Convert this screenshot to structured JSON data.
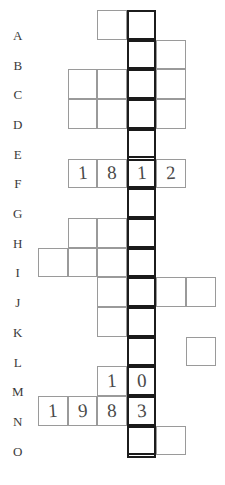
{
  "puzzle": {
    "type": "numeric-crossword-grid",
    "row_count": 15,
    "column_count": 7,
    "row_labels": [
      "A",
      "B",
      "C",
      "D",
      "E",
      "F",
      "G",
      "H",
      "I",
      "J",
      "K",
      "L",
      "M",
      "N",
      "O"
    ],
    "highlighted_column_label": "bold-double-column",
    "grid_origin": {
      "x": 38,
      "y": 10
    },
    "cell_width": 29.6,
    "cell_height": 29.7,
    "line_color": "#9a9a9a",
    "bold_line_color": "#1c1c1c",
    "ink_color": "#4a4a4a",
    "rows": [
      {
        "label": "A",
        "cells": [
          {
            "col": 2
          },
          {
            "col": 3,
            "bold": true
          }
        ]
      },
      {
        "label": "B",
        "cells": [
          {
            "col": 3,
            "bold": true
          },
          {
            "col": 4
          }
        ]
      },
      {
        "label": "C",
        "cells": [
          {
            "col": 1
          },
          {
            "col": 2
          },
          {
            "col": 3,
            "bold": true
          },
          {
            "col": 4
          }
        ]
      },
      {
        "label": "D",
        "cells": [
          {
            "col": 1
          },
          {
            "col": 2
          },
          {
            "col": 3,
            "bold": true
          },
          {
            "col": 4
          }
        ]
      },
      {
        "label": "E",
        "cells": [
          {
            "col": 3,
            "bold": true
          }
        ]
      },
      {
        "label": "F",
        "cells": [
          {
            "col": 1,
            "value": "1"
          },
          {
            "col": 2,
            "value": "8"
          },
          {
            "col": 3,
            "bold": true,
            "value": "1"
          },
          {
            "col": 4,
            "value": "2"
          }
        ]
      },
      {
        "label": "G",
        "cells": [
          {
            "col": 3,
            "bold": true
          }
        ]
      },
      {
        "label": "H",
        "cells": [
          {
            "col": 1
          },
          {
            "col": 2
          },
          {
            "col": 3,
            "bold": true
          }
        ]
      },
      {
        "label": "I",
        "cells": [
          {
            "col": 0
          },
          {
            "col": 1
          },
          {
            "col": 2
          },
          {
            "col": 3,
            "bold": true
          }
        ]
      },
      {
        "label": "J",
        "cells": [
          {
            "col": 2
          },
          {
            "col": 3,
            "bold": true
          },
          {
            "col": 4
          },
          {
            "col": 5
          }
        ]
      },
      {
        "label": "K",
        "cells": [
          {
            "col": 2
          },
          {
            "col": 3,
            "bold": true
          }
        ]
      },
      {
        "label": "L",
        "cells": [
          {
            "col": 3,
            "bold": true
          },
          {
            "col": 5
          }
        ]
      },
      {
        "label": "M",
        "cells": [
          {
            "col": 2,
            "value": "1"
          },
          {
            "col": 3,
            "bold": true,
            "value": "0"
          }
        ]
      },
      {
        "label": "N",
        "cells": [
          {
            "col": 0,
            "value": "1"
          },
          {
            "col": 1,
            "value": "9"
          },
          {
            "col": 2,
            "value": "8"
          },
          {
            "col": 3,
            "bold": true,
            "value": "3"
          }
        ]
      },
      {
        "label": "O",
        "cells": [
          {
            "col": 3,
            "bold": true
          },
          {
            "col": 4
          }
        ]
      }
    ],
    "entries": [
      {
        "row": "F",
        "text": "1812"
      },
      {
        "row": "M",
        "text": "10"
      },
      {
        "row": "N",
        "text": "1983"
      }
    ]
  }
}
